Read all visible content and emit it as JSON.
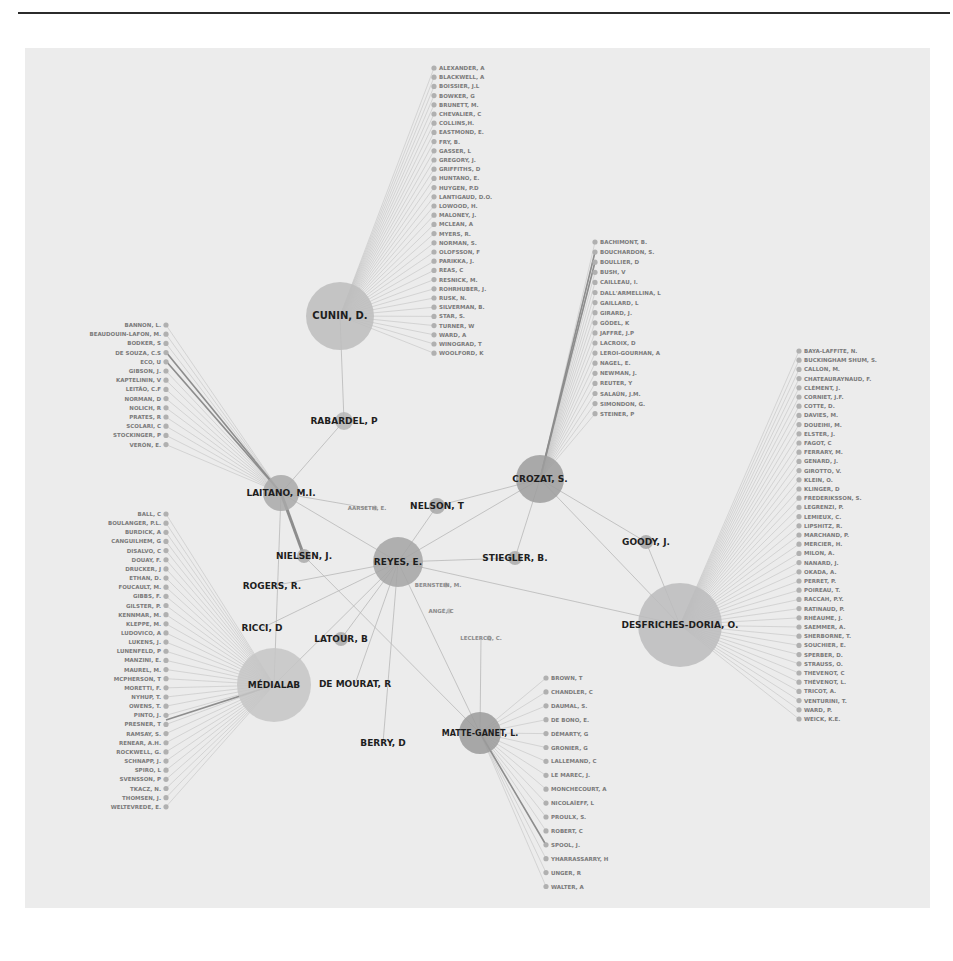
{
  "colors": {
    "background": "#ececec",
    "page": "#ffffff",
    "rule": "#2b2b2b",
    "hub_fill": "#b9b9b9",
    "hub_fill_dark": "#9a9a9a",
    "leaf_node": "#b0b0b0",
    "edge": "#c2c2c2",
    "edge_strong": "#8d8d8d",
    "hub_label": "#1e1e1e",
    "leaf_label": "#7a7a7a"
  },
  "hubs": [
    {
      "id": "cunin",
      "label": "CUNIN, D.",
      "x": 340,
      "y": 316,
      "r": 34,
      "fs": 10,
      "fill": "#bdbdbd"
    },
    {
      "id": "rabardel",
      "label": "RABARDEL, P",
      "x": 344,
      "y": 421,
      "r": 9,
      "fs": 9,
      "fill": "#b6b6b6"
    },
    {
      "id": "laitano",
      "label": "LAITANO, M.I.",
      "x": 281,
      "y": 493,
      "r": 18,
      "fs": 9,
      "fill": "#a9a9a9"
    },
    {
      "id": "crozat",
      "label": "CROZAT, S.",
      "x": 540,
      "y": 479,
      "r": 24,
      "fs": 9,
      "fill": "#9d9d9d"
    },
    {
      "id": "nelson",
      "label": "NELSON, T",
      "x": 437,
      "y": 506,
      "r": 8,
      "fs": 9,
      "fill": "#a8a8a8"
    },
    {
      "id": "reyes",
      "label": "REYES, E.",
      "x": 398,
      "y": 562,
      "r": 25,
      "fs": 9,
      "fill": "#a4a4a4"
    },
    {
      "id": "nielsen",
      "label": "NIELSEN, J.",
      "x": 304,
      "y": 556,
      "r": 7,
      "fs": 9,
      "fill": "#aaaaaa"
    },
    {
      "id": "stiegler",
      "label": "STIEGLER, B.",
      "x": 515,
      "y": 558,
      "r": 7,
      "fs": 9,
      "fill": "#aaaaaa"
    },
    {
      "id": "goody",
      "label": "GOODY, J.",
      "x": 646,
      "y": 542,
      "r": 7,
      "fs": 9,
      "fill": "#a6a6a6"
    },
    {
      "id": "rogers",
      "label": "ROGERS, R.",
      "x": 272,
      "y": 586,
      "r": 0,
      "fs": 9,
      "fill": "#aaaaaa"
    },
    {
      "id": "ricci",
      "label": "RICCI, D",
      "x": 262,
      "y": 628,
      "r": 0,
      "fs": 9,
      "fill": "#aaaaaa"
    },
    {
      "id": "latour",
      "label": "LATOUR, B",
      "x": 341,
      "y": 639,
      "r": 7,
      "fs": 9,
      "fill": "#aaaaaa"
    },
    {
      "id": "medialab",
      "label": "MÉDIALAB",
      "x": 274,
      "y": 685,
      "r": 37,
      "fs": 9,
      "fill": "#c6c6c6"
    },
    {
      "id": "demourat",
      "label": "DE MOURAT, R",
      "x": 355,
      "y": 684,
      "r": 0,
      "fs": 9,
      "fill": "#aaaaaa"
    },
    {
      "id": "desfriches",
      "label": "DESFRICHES-DORIA, O.",
      "x": 680,
      "y": 625,
      "r": 42,
      "fs": 9,
      "fill": "#bcbcbd"
    },
    {
      "id": "matte",
      "label": "MATTE-GANET, L.",
      "x": 480,
      "y": 733,
      "r": 21,
      "fs": 8,
      "fill": "#9b9b9b"
    },
    {
      "id": "berry",
      "label": "BERRY, D",
      "x": 383,
      "y": 743,
      "r": 0,
      "fs": 9,
      "fill": "#aaaaaa"
    }
  ],
  "minor_nodes": [
    {
      "label": "AARSETH, E.",
      "x": 367,
      "y": 508
    },
    {
      "label": "BERNSTEIN, M.",
      "x": 438,
      "y": 585
    },
    {
      "label": "ANGÉ, C",
      "x": 441,
      "y": 611
    },
    {
      "label": "LECLERCQ, C.",
      "x": 481,
      "y": 638
    }
  ],
  "edges": [
    [
      "cunin",
      "rabardel"
    ],
    [
      "rabardel",
      "laitano"
    ],
    [
      "laitano",
      "reyes"
    ],
    [
      "laitano",
      "nielsen"
    ],
    [
      "laitano",
      "medialab"
    ],
    [
      "crozat",
      "reyes"
    ],
    [
      "crozat",
      "stiegler"
    ],
    [
      "crozat",
      "nelson"
    ],
    [
      "crozat",
      "desfriches"
    ],
    [
      "crozat",
      "goody"
    ],
    [
      "reyes",
      "nelson"
    ],
    [
      "reyes",
      "stiegler"
    ],
    [
      "reyes",
      "rogers"
    ],
    [
      "reyes",
      "ricci"
    ],
    [
      "reyes",
      "latour"
    ],
    [
      "reyes",
      "demourat"
    ],
    [
      "reyes",
      "berry"
    ],
    [
      "reyes",
      "desfriches"
    ],
    [
      "reyes",
      "matte"
    ],
    [
      "reyes",
      "medialab"
    ],
    [
      "nielsen",
      "matte"
    ],
    [
      "goody",
      "desfriches"
    ],
    [
      "matte",
      "leclercq"
    ],
    [
      "laitano",
      "aarseth"
    ]
  ],
  "leaf_groups": [
    {
      "hub": "cunin",
      "side": "right",
      "x": 434,
      "y0": 68,
      "dy": 9.2,
      "items": [
        "ALEXANDER, A",
        "BLACKWELL, A",
        "BOISSIER, J.L",
        "BOWKER, G",
        "BRUNETT, M.",
        "CHEVALIER, C",
        "COLLINS,H.",
        "EASTMOND, E.",
        "FRY, B.",
        "GASSER, L",
        "GREGORY, J.",
        "GRIFFITHS, D",
        "HUNTANO, E.",
        "HUYGEN, P.D",
        "LANTIGAUD, D.O.",
        "LOWOOD, H.",
        "MALONEY, J.",
        "MCLEAN, A",
        "MYERS, R.",
        "NORMAN, S.",
        "OLOFSSON, F",
        "PARIKKA, J.",
        "REAS, C",
        "RESNICK, M.",
        "ROHRHUBER, J.",
        "RUSK, N.",
        "SILVERMAN, B.",
        "STAR, S.",
        "TURNER, W",
        "WARD, A",
        "WINOGRAD, T",
        "WOOLFORD, K"
      ]
    },
    {
      "hub": "laitano",
      "side": "left",
      "x": 166,
      "y0": 325,
      "dy": 9.2,
      "items": [
        "BANNON, L.",
        "BEAUDOUIN-LAFON, M.",
        "BODKER, S",
        "DE SOUZA, C.S",
        "ECO, U",
        "GIBSON, J.",
        "KAPTELININ, V",
        "LEITÃO, C.F",
        "NORMAN, D",
        "NOLICH, R",
        "PRATES, R",
        "SCOLARI, C",
        "STOCKINGER, P",
        "VERÓN, E."
      ]
    },
    {
      "hub": "crozat",
      "side": "right",
      "x": 595,
      "y0": 242,
      "dy": 10.1,
      "items": [
        "BACHIMONT, B.",
        "BOUCHARDON, S.",
        "BOULLIER, D",
        "BUSH, V",
        "CAILLEAU, I.",
        "DALL'ARMELLINA, L",
        "GAILLARD, L",
        "GIRARD, J.",
        "GÖDEL, K",
        "JAFFRÉ, J.P",
        "LACROIX, D",
        "LEROI-GOURHAN, A",
        "NAGEL, E.",
        "NEWMAN, J.",
        "REUTER, Y",
        "SALAÜN, J.M.",
        "SIMONDON, G.",
        "STEINER, P"
      ]
    },
    {
      "hub": "desfriches",
      "side": "right",
      "x": 799,
      "y0": 351,
      "dy": 9.2,
      "items": [
        "BAYA-LAFFITE, N.",
        "BUCKINGHAM SHUM, S.",
        "CALLON, M.",
        "CHATEAURAYNAUD, F.",
        "CLÉMENT, J.",
        "CORNIET, J.F.",
        "COTTE, D.",
        "DAVIES, M.",
        "DOUEIHI, M.",
        "ELSTER, J.",
        "FAGOT, C",
        "FERRARY, M.",
        "GENARD, J.",
        "GIROTTO, V.",
        "KLEIN, O.",
        "KLINGER, D",
        "FREDERIKSSON, S.",
        "LEGRENZI, P.",
        "LEMIEUX, C.",
        "LIPSHITZ, R.",
        "MARCHAND, P.",
        "MERCIER, H.",
        "MILON, A.",
        "NANARD, J.",
        "OKADA, A.",
        "PERRET, P.",
        "POIREAU, T.",
        "RACCAH, P.Y.",
        "RATINAUD, P.",
        "RHÉAUME, J.",
        "SAEMMER, A.",
        "SHERBORNE, T.",
        "SOUCHIER, E.",
        "SPERBER, D.",
        "STRAUSS, O.",
        "THEVENOT, C",
        "THÉVENOT, L.",
        "TRICOT, A.",
        "VENTURINI, T.",
        "WARD, P.",
        "WEICK, K.E."
      ]
    },
    {
      "hub": "medialab",
      "side": "left",
      "x": 166,
      "y0": 514,
      "dy": 9.15,
      "items": [
        "BALL, C",
        "BOULANGER, P.L.",
        "BURDICK, A",
        "CANGUILHEM, G",
        "DISALVO, C",
        "DOUAY, F.",
        "DRUCKER, J",
        "ETHAN, D.",
        "FOUCAULT, M.",
        "GIBBS, F.",
        "GILSTER, P.",
        "KENNMAR, M.",
        "KLEPPE, M.",
        "LUDOVICO, A",
        "LUKENS, J.",
        "LUNENFELD, P",
        "MANZINI, E.",
        "MAUREL, M.",
        "MCPHERSON, T",
        "MORETTI, F.",
        "NYHUP, T.",
        "OWENS, T.",
        "PINTO, J.",
        "PRESNER, T",
        "RAMSAY, S.",
        "RENEAR, A.H.",
        "ROCKWELL, G.",
        "SCHNAPP, J.",
        "SPIRO, L",
        "SVENSSON, P",
        "TKACZ, N.",
        "THOMSEN, J.",
        "WELTEVREDE, E."
      ]
    },
    {
      "hub": "matte",
      "side": "right",
      "x": 546,
      "y0": 678,
      "dy": 13.9,
      "items": [
        "BROWN, T",
        "CHANDLER, C",
        "DAUMAL, S.",
        "DE BONO, E.",
        "DÉMARTY, G",
        "GRONIER, G",
        "LALLEMAND, C",
        "LE MAREC, J.",
        "MONCHECOURT, A",
        "NICOLAÏEFF, L",
        "PROULX, S.",
        "ROBERT, C",
        "SPOOL, J.",
        "YHARRASSARRY, H",
        "UNGER, R",
        "WALTER, A"
      ]
    }
  ]
}
